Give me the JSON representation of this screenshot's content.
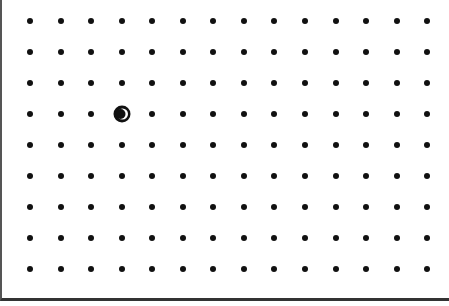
{
  "game": {
    "name": "dot-grid board",
    "grid": {
      "columns": 14,
      "rows": 9,
      "origin_x": 28,
      "origin_y": 21,
      "step_x": 30.55,
      "step_y": 31.0
    },
    "player": {
      "column": 3,
      "row": 3,
      "icon": "crescent-ring-icon",
      "color": "#111111"
    },
    "dot_color": "#111111",
    "background": "#ffffff"
  }
}
